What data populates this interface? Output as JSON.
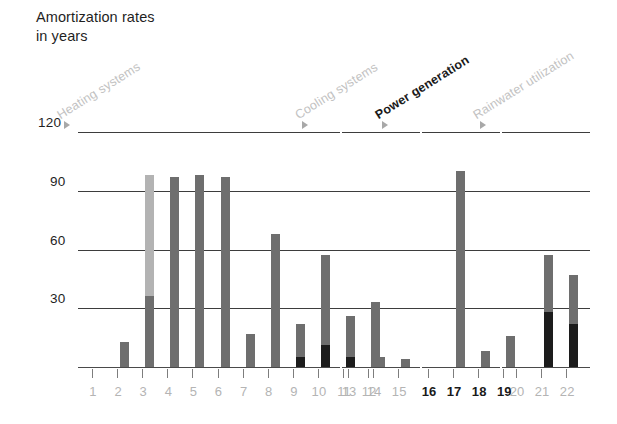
{
  "title": "Amortization rates\nin years",
  "colors": {
    "bar_gray": "#6e6e6e",
    "bar_light": "#b3b3b3",
    "bar_dark": "#1c1c1c",
    "gridline": "#3d3d3d",
    "muted_text": "#bcbcbc",
    "highlight_text": "#1a1a1a",
    "marker": "#a8a8a8"
  },
  "sections": [
    {
      "id": "heating",
      "label": "Heating systems",
      "highlight": false,
      "marker": "triangle-right-marker"
    },
    {
      "id": "cooling",
      "label": "Cooling systems",
      "highlight": false,
      "marker": "triangle-right-marker"
    },
    {
      "id": "power",
      "label": "Power generation",
      "highlight": true,
      "marker": "triangle-right-marker"
    },
    {
      "id": "rainwater",
      "label": "Rainwater utilization",
      "highlight": false,
      "marker": "triangle-right-marker"
    }
  ],
  "chart_data": {
    "type": "bar",
    "title": "Amortization rates in years",
    "xlabel": "",
    "ylabel": "years",
    "ylim": [
      0,
      120
    ],
    "yticks": [
      30,
      60,
      90,
      120
    ],
    "grid": true,
    "legend": null,
    "stacked": true,
    "groups": [
      {
        "name": "Heating systems",
        "highlight": false,
        "categories": [
          "1",
          "2",
          "3",
          "4",
          "5",
          "6",
          "7",
          "8",
          "9",
          "10",
          "11",
          "12"
        ],
        "values": [
          0,
          13,
          98,
          97,
          98,
          97,
          17,
          68,
          22,
          57,
          26,
          33
        ],
        "segments_dark": [
          0,
          0,
          0,
          0,
          0,
          0,
          0,
          0,
          5,
          11,
          5,
          0
        ],
        "segments_light_top": [
          0,
          0,
          62,
          0,
          0,
          0,
          0,
          0,
          0,
          0,
          0,
          0
        ]
      },
      {
        "name": "Cooling systems",
        "highlight": false,
        "categories": [
          "13",
          "14",
          "15"
        ],
        "values": [
          0,
          5,
          4
        ],
        "segments_dark": [
          0,
          0,
          0
        ],
        "segments_light_top": [
          0,
          0,
          0
        ]
      },
      {
        "name": "Power generation",
        "highlight": true,
        "categories": [
          "16",
          "17",
          "18",
          "19"
        ],
        "values": [
          0,
          100,
          8,
          16
        ],
        "segments_dark": [
          0,
          0,
          0,
          0
        ],
        "segments_light_top": [
          0,
          0,
          0,
          0
        ]
      },
      {
        "name": "Rainwater utilization",
        "highlight": false,
        "categories": [
          "20",
          "21",
          "22"
        ],
        "values": [
          0,
          57,
          47
        ],
        "segments_dark": [
          0,
          28,
          22
        ],
        "segments_light_top": [
          0,
          0,
          0
        ]
      }
    ]
  }
}
